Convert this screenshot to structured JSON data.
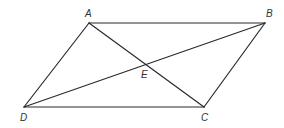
{
  "diagram": {
    "type": "parallelogram-with-diagonals",
    "colors": {
      "stroke": "#2a2a2a",
      "label": "#333333",
      "background": "#ffffff"
    },
    "points": {
      "A": {
        "label": "A",
        "x": 89,
        "y": 23,
        "lx": 85,
        "ly": 17
      },
      "B": {
        "label": "B",
        "x": 265,
        "y": 23,
        "lx": 266,
        "ly": 17
      },
      "C": {
        "label": "C",
        "x": 204,
        "y": 107,
        "lx": 201,
        "ly": 121
      },
      "D": {
        "label": "D",
        "x": 24,
        "y": 107,
        "lx": 20,
        "ly": 121
      },
      "E": {
        "label": "E",
        "x": 146.5,
        "y": 65,
        "lx": 141,
        "ly": 78
      }
    },
    "segments": [
      {
        "name": "AB",
        "from": "A",
        "to": "B"
      },
      {
        "name": "BC",
        "from": "B",
        "to": "C"
      },
      {
        "name": "CD",
        "from": "C",
        "to": "D"
      },
      {
        "name": "DA",
        "from": "D",
        "to": "A"
      },
      {
        "name": "AC",
        "from": "A",
        "to": "C"
      },
      {
        "name": "DB",
        "from": "D",
        "to": "B"
      }
    ]
  }
}
